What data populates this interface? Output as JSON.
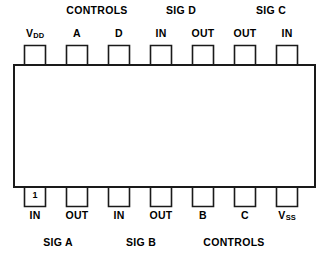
{
  "diagram": {
    "package": {
      "pin_count": 14,
      "pin_one_marker": "1",
      "outline_color": "#1a1a1a",
      "fill_color": "#ffffff"
    },
    "top_group_labels": [
      {
        "text": "CONTROLS",
        "x": 97,
        "y": 4
      },
      {
        "text": "SIG D",
        "x": 181,
        "y": 4
      },
      {
        "text": "SIG C",
        "x": 271,
        "y": 4
      }
    ],
    "bottom_group_labels": [
      {
        "text": "SIG A",
        "x": 58,
        "y": 236
      },
      {
        "text": "SIG B",
        "x": 141,
        "y": 236
      },
      {
        "text": "CONTROLS",
        "x": 234,
        "y": 236
      }
    ],
    "top_pins": [
      {
        "label": "V",
        "sub": "DD",
        "x": 35,
        "y": 27
      },
      {
        "label": "A",
        "sub": "",
        "x": 77,
        "y": 27
      },
      {
        "label": "D",
        "sub": "",
        "x": 119,
        "y": 27
      },
      {
        "label": "IN",
        "sub": "",
        "x": 161,
        "y": 27
      },
      {
        "label": "OUT",
        "sub": "",
        "x": 203,
        "y": 27
      },
      {
        "label": "OUT",
        "sub": "",
        "x": 245,
        "y": 27
      },
      {
        "label": "IN",
        "sub": "",
        "x": 287,
        "y": 27
      }
    ],
    "bottom_pins": [
      {
        "label": "IN",
        "sub": "",
        "x": 35,
        "y": 209
      },
      {
        "label": "OUT",
        "sub": "",
        "x": 77,
        "y": 209
      },
      {
        "label": "IN",
        "sub": "",
        "x": 119,
        "y": 209
      },
      {
        "label": "OUT",
        "sub": "",
        "x": 161,
        "y": 209
      },
      {
        "label": "B",
        "sub": "",
        "x": 203,
        "y": 209
      },
      {
        "label": "C",
        "sub": "",
        "x": 245,
        "y": 209
      },
      {
        "label": "V",
        "sub": "SS",
        "x": 287,
        "y": 209
      }
    ]
  }
}
